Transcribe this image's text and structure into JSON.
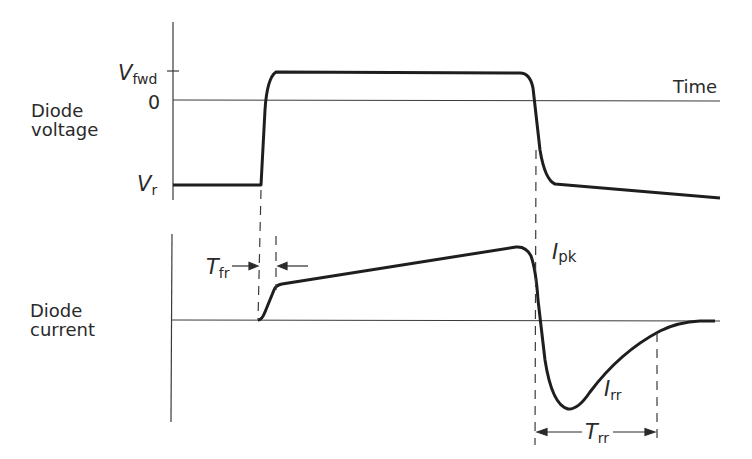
{
  "diagram": {
    "voltage_panel": {
      "label_line1": "Diode",
      "label_line2": "voltage",
      "y_ticks": {
        "vfwd_main": "V",
        "vfwd_sub": "fwd",
        "zero": "0",
        "vr_main": "V",
        "vr_sub": "r"
      },
      "x_axis_label": "Time"
    },
    "current_panel": {
      "label_line1": "Diode",
      "label_line2": "current",
      "annotations": {
        "tfr_main": "T",
        "tfr_sub": "fr",
        "ipk_main": "I",
        "ipk_sub": "pk",
        "irr_main": "I",
        "irr_sub": "rr",
        "trr_main": "T",
        "trr_sub": "rr"
      }
    },
    "colors": {
      "curve": "#1e1e1e",
      "axis": "#3a3a3a",
      "text": "#2a2a2a"
    }
  }
}
